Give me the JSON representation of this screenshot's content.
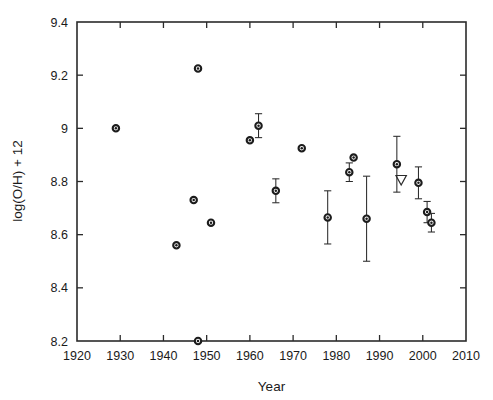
{
  "chart_data": {
    "type": "scatter",
    "title": "",
    "xlabel": "Year",
    "ylabel": "log(O/H) + 12",
    "xlim": [
      1920,
      2010
    ],
    "ylim": [
      8.2,
      9.4
    ],
    "xticks": [
      1920,
      1930,
      1940,
      1950,
      1960,
      1970,
      1980,
      1990,
      2000,
      2010
    ],
    "yticks": [
      8.2,
      8.4,
      8.6,
      8.8,
      9,
      9.2,
      9.4
    ],
    "xtick_labels": [
      "1920",
      "1930",
      "1940",
      "1950",
      "1960",
      "1970",
      "1980",
      "1990",
      "2000",
      "2010"
    ],
    "ytick_labels": [
      "8.2",
      "8.4",
      "8.6",
      "8.8",
      "9",
      "9.2",
      "9.4"
    ],
    "grid": false,
    "legend": "none",
    "marker_styles": {
      "circle": "open circle with filled center dot",
      "triangle_down": "open downward triangle (upper limit)"
    },
    "points": [
      {
        "x": 1929,
        "y": 9.0,
        "yerr": null,
        "marker": "circle"
      },
      {
        "x": 1943,
        "y": 8.56,
        "yerr": null,
        "marker": "circle"
      },
      {
        "x": 1948,
        "y": 9.225,
        "yerr": null,
        "marker": "circle"
      },
      {
        "x": 1948,
        "y": 8.2,
        "yerr": null,
        "marker": "circle"
      },
      {
        "x": 1947,
        "y": 8.73,
        "yerr": null,
        "marker": "circle"
      },
      {
        "x": 1951,
        "y": 8.645,
        "yerr": null,
        "marker": "circle"
      },
      {
        "x": 1960,
        "y": 8.955,
        "yerr": null,
        "marker": "circle"
      },
      {
        "x": 1962,
        "y": 9.01,
        "yerr": 0.045,
        "marker": "circle"
      },
      {
        "x": 1966,
        "y": 8.765,
        "yerr": 0.045,
        "marker": "circle"
      },
      {
        "x": 1972,
        "y": 8.925,
        "yerr": null,
        "marker": "circle"
      },
      {
        "x": 1978,
        "y": 8.665,
        "yerr": 0.1,
        "marker": "circle"
      },
      {
        "x": 1983,
        "y": 8.835,
        "yerr": 0.035,
        "marker": "circle"
      },
      {
        "x": 1984,
        "y": 8.89,
        "yerr": null,
        "marker": "circle"
      },
      {
        "x": 1987,
        "y": 8.66,
        "yerr": 0.16,
        "marker": "circle"
      },
      {
        "x": 1994,
        "y": 8.865,
        "yerr": 0.105,
        "marker": "circle"
      },
      {
        "x": 1995,
        "y": 8.805,
        "yerr": null,
        "marker": "triangle_down"
      },
      {
        "x": 1999,
        "y": 8.795,
        "yerr": 0.06,
        "marker": "circle"
      },
      {
        "x": 2001,
        "y": 8.685,
        "yerr": 0.04,
        "marker": "circle"
      },
      {
        "x": 2002,
        "y": 8.645,
        "yerr": 0.035,
        "marker": "circle"
      }
    ]
  }
}
